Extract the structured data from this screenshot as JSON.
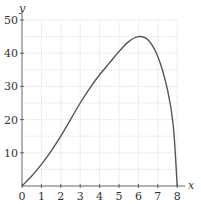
{
  "chart_data": {
    "type": "line",
    "title": "",
    "xlabel": "x",
    "ylabel": "y",
    "xlim": [
      0,
      8
    ],
    "ylim": [
      0,
      50
    ],
    "grid": true,
    "x_ticks": [
      "0",
      "1",
      "2",
      "3",
      "4",
      "5",
      "6",
      "7",
      "8"
    ],
    "y_ticks": [
      "10",
      "20",
      "30",
      "40",
      "50"
    ],
    "series": [
      {
        "name": "curve",
        "x": [
          0,
          0.5,
          1,
          1.5,
          2,
          2.5,
          3,
          3.5,
          4,
          4.5,
          5,
          5.5,
          6,
          6.5,
          7,
          7.5,
          7.8,
          8
        ],
        "y": [
          0,
          3,
          6.5,
          10.5,
          15,
          20,
          25,
          29.5,
          33.5,
          37,
          40.5,
          43.5,
          45,
          44,
          39,
          29,
          18,
          0
        ]
      }
    ]
  }
}
